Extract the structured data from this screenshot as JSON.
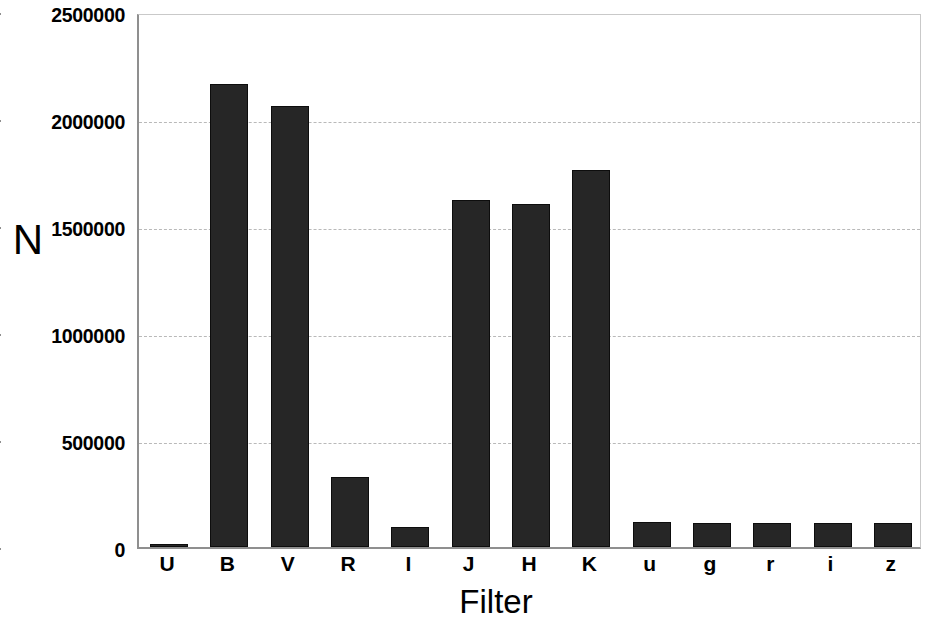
{
  "chart_data": {
    "type": "bar",
    "title": "",
    "xlabel": "Filter",
    "ylabel": "N",
    "categories": [
      "U",
      "B",
      "V",
      "R",
      "I",
      "J",
      "H",
      "K",
      "u",
      "g",
      "r",
      "i",
      "z"
    ],
    "values": [
      5000,
      2163000,
      2060000,
      325000,
      95000,
      1620000,
      1605000,
      1762000,
      115000,
      113000,
      113000,
      113000,
      110000
    ],
    "ylim": [
      0,
      2500000
    ],
    "yticks": [
      0,
      500000,
      1000000,
      1500000,
      2000000,
      2500000
    ],
    "ytick_labels": [
      "0",
      "500000",
      "1000000",
      "1500000",
      "2000000",
      "2500000"
    ],
    "grid": true,
    "legend": null,
    "bar_color": "#262626",
    "grid_color": "#b9b9b9",
    "axis_color": "#8f8f8f"
  }
}
